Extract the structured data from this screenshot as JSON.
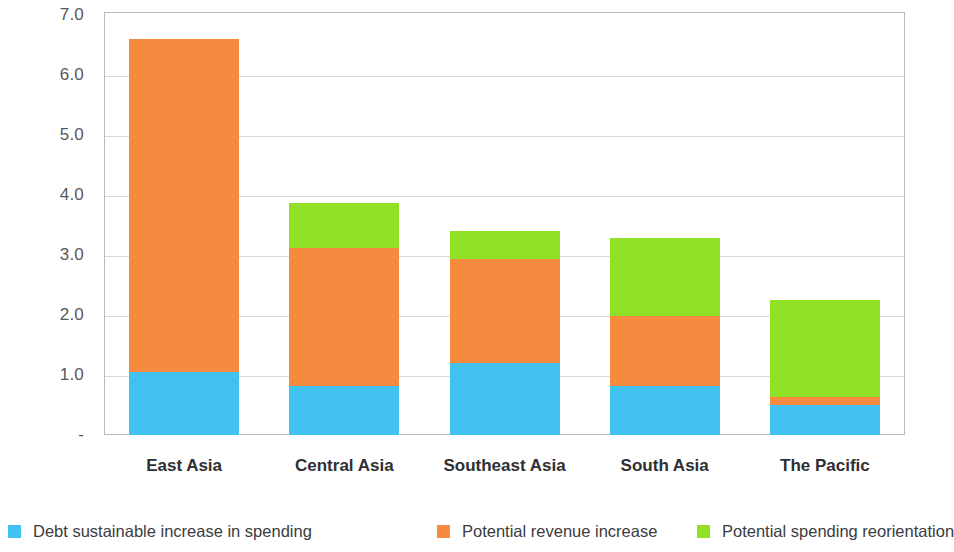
{
  "chart_data": {
    "type": "bar",
    "stacked": true,
    "title": "",
    "subtitle": "",
    "xlabel": "",
    "ylabel": "",
    "categories": [
      "East Asia",
      "Central Asia",
      "Southeast Asia",
      "South Asia",
      "The Pacific"
    ],
    "series": [
      {
        "name": "Debt sustainable increase in spending",
        "color": "#41c1ef",
        "values": [
          1.05,
          0.82,
          1.2,
          0.82,
          0.5
        ]
      },
      {
        "name": "Potential revenue increase",
        "color": "#f68b3f",
        "values": [
          5.55,
          2.3,
          1.73,
          1.16,
          0.13
        ]
      },
      {
        "name": "Potential spending reorientation",
        "color": "#8fe026",
        "values": [
          0.0,
          0.75,
          0.47,
          1.3,
          1.62
        ]
      }
    ],
    "totals": [
      6.6,
      3.87,
      3.4,
      3.28,
      2.25
    ],
    "ylim": [
      0,
      7.0
    ],
    "ytick_values": [
      7.0,
      6.0,
      5.0,
      4.0,
      3.0,
      2.0,
      1.0,
      0
    ],
    "ytick_labels": [
      "7.0",
      "6.0",
      "5.0",
      "4.0",
      "3.0",
      "2.0",
      "1.0",
      "-"
    ],
    "grid": true,
    "legend_position": "bottom"
  },
  "axis": {
    "y_labels": [
      "7.0",
      "6.0",
      "5.0",
      "4.0",
      "3.0",
      "2.0",
      "1.0",
      "-"
    ],
    "x_labels": [
      "East Asia",
      "Central Asia",
      "Southeast Asia",
      "South Asia",
      "The Pacific"
    ]
  },
  "legend": {
    "items": [
      {
        "label": "Debt sustainable increase in spending",
        "color": "#41c1ef"
      },
      {
        "label": "Potential revenue increase",
        "color": "#f68b3f"
      },
      {
        "label": "Potential spending reorientation",
        "color": "#8fe026"
      }
    ]
  },
  "colors": {
    "blue": "#41c1ef",
    "orange": "#f68b3f",
    "green": "#8fe026",
    "grid": "#d7d7dc",
    "frame": "#b9b9bd",
    "axis_text": "#58585b",
    "category_text": "#2f2f33",
    "background": "#ffffff"
  }
}
